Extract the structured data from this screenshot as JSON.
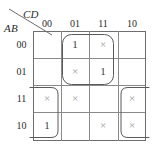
{
  "diagram": {
    "type": "karnaugh-map",
    "column_variable_label": "CD",
    "row_variable_label": "AB",
    "column_headers": [
      "00",
      "01",
      "11",
      "10"
    ],
    "row_headers": [
      "00",
      "01",
      "11",
      "10"
    ],
    "cells": [
      {
        "row": "00",
        "col": "00",
        "value": ""
      },
      {
        "row": "00",
        "col": "01",
        "value": "1"
      },
      {
        "row": "00",
        "col": "11",
        "value": "×"
      },
      {
        "row": "00",
        "col": "10",
        "value": ""
      },
      {
        "row": "01",
        "col": "00",
        "value": ""
      },
      {
        "row": "01",
        "col": "01",
        "value": "×"
      },
      {
        "row": "01",
        "col": "11",
        "value": "1"
      },
      {
        "row": "01",
        "col": "10",
        "value": ""
      },
      {
        "row": "11",
        "col": "00",
        "value": "×"
      },
      {
        "row": "11",
        "col": "01",
        "value": "×"
      },
      {
        "row": "11",
        "col": "11",
        "value": ""
      },
      {
        "row": "11",
        "col": "10",
        "value": "×"
      },
      {
        "row": "10",
        "col": "00",
        "value": "1"
      },
      {
        "row": "10",
        "col": "01",
        "value": ""
      },
      {
        "row": "10",
        "col": "11",
        "value": "×"
      },
      {
        "row": "10",
        "col": "10",
        "value": "×"
      }
    ],
    "groups": [
      {
        "name": "center-block-group",
        "cells": [
          "00/01",
          "00/11",
          "01/01",
          "01/11"
        ],
        "shape": "closed-rounded-rect"
      },
      {
        "name": "left-column-wrap-group",
        "cells": [
          "11/00",
          "10/00"
        ],
        "shape": "open-left-wrap"
      },
      {
        "name": "right-column-wrap-group",
        "cells": [
          "11/10",
          "10/10"
        ],
        "shape": "open-right-wrap"
      }
    ],
    "colors": {
      "grid_line": "#8a8a8a",
      "grid_outer": "#6e6e6e",
      "loop": "#5a5a5a",
      "value_one": "#3a3a3a",
      "value_dontcare": "#9a9a9a",
      "label": "#2b2b2b",
      "background": "#ffffff"
    }
  }
}
